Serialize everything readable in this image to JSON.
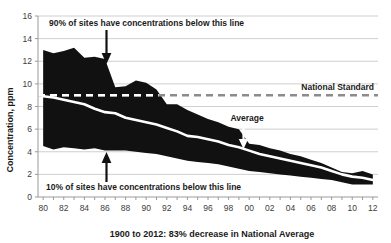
{
  "chart_data": {
    "type": "area",
    "title": "",
    "subtitle": "",
    "xlabel": "1900 to 2012: 83% decrease in National Average",
    "ylabel": "Concentration, ppm",
    "xlim": [
      1979.5,
      2012.5
    ],
    "ylim": [
      0,
      16
    ],
    "ytick_values": [
      0,
      2,
      4,
      6,
      8,
      10,
      12,
      14,
      16
    ],
    "ytick_labels": [
      "0",
      "2",
      "4",
      "6",
      "8",
      "10",
      "12",
      "14",
      "16"
    ],
    "xtick_labels": [
      "80",
      "82",
      "84",
      "86",
      "88",
      "90",
      "92",
      "94",
      "96",
      "98",
      "00",
      "02",
      "04",
      "06",
      "08",
      "10",
      "12"
    ],
    "xtick_values": [
      1980,
      1982,
      1984,
      1986,
      1988,
      1990,
      1992,
      1994,
      1996,
      1998,
      2000,
      2002,
      2004,
      2006,
      2008,
      2010,
      2012
    ],
    "minor_tick_step": 1,
    "grid": "horizontal",
    "legend": "none",
    "x": [
      1980,
      1981,
      1982,
      1983,
      1984,
      1985,
      1986,
      1987,
      1988,
      1989,
      1990,
      1991,
      1992,
      1993,
      1994,
      1995,
      1996,
      1997,
      1998,
      1999,
      2000,
      2001,
      2002,
      2003,
      2004,
      2005,
      2006,
      2007,
      2008,
      2009,
      2010,
      2011,
      2012
    ],
    "series": [
      {
        "name": "90th percentile",
        "role": "band-upper",
        "color": "#111111",
        "values": [
          13.0,
          12.7,
          12.9,
          13.2,
          12.3,
          12.4,
          12.2,
          9.7,
          9.8,
          10.3,
          10.1,
          9.5,
          8.2,
          8.2,
          7.7,
          7.3,
          6.9,
          6.6,
          6.2,
          6.0,
          4.7,
          4.6,
          4.3,
          4.1,
          3.8,
          3.6,
          3.3,
          3.0,
          2.6,
          2.2,
          2.1,
          2.3,
          2.0
        ]
      },
      {
        "name": "Average",
        "role": "mean-line",
        "color": "#ffffff",
        "values": [
          8.9,
          8.8,
          8.6,
          8.4,
          8.2,
          7.8,
          7.5,
          7.4,
          7.0,
          6.8,
          6.6,
          6.4,
          6.1,
          5.8,
          5.4,
          5.3,
          5.1,
          4.9,
          4.6,
          4.4,
          4.1,
          3.8,
          3.6,
          3.4,
          3.2,
          3.0,
          2.8,
          2.6,
          2.3,
          2.0,
          1.8,
          1.7,
          1.5
        ]
      },
      {
        "name": "10th percentile",
        "role": "band-lower",
        "color": "#111111",
        "values": [
          4.5,
          4.2,
          4.4,
          4.3,
          4.2,
          4.3,
          4.1,
          4.1,
          4.1,
          4.0,
          3.9,
          3.8,
          3.6,
          3.4,
          3.2,
          3.1,
          3.0,
          2.9,
          2.7,
          2.5,
          2.3,
          2.2,
          2.1,
          2.0,
          1.9,
          1.8,
          1.7,
          1.6,
          1.5,
          1.3,
          1.1,
          1.1,
          1.1
        ]
      }
    ],
    "reference_lines": [
      {
        "name": "National Standard",
        "value": 9.0,
        "style": "dashed",
        "color": "#8c8c8c",
        "label": "National Standard",
        "label_position": "right-above"
      }
    ],
    "annotations": [
      {
        "name": "upper-percentile-note",
        "text": "90% of sites have concentrations below this line",
        "arrow": "down",
        "points_to_year": 1986,
        "points_to_value": 12.2
      },
      {
        "name": "lower-percentile-note",
        "text": "10% of sites have concentrations below this line",
        "arrow": "up",
        "points_to_year": 1986,
        "points_to_value": 4.1
      },
      {
        "name": "average-note",
        "text": "Average",
        "arrow": "down",
        "points_to_year": 1999.5,
        "points_to_value": 4.4
      }
    ]
  },
  "colors": {
    "band": "#111111",
    "average_line": "#ffffff",
    "standard_line": "#8c8c8c",
    "gridline": "#c9c9c9",
    "axis": "#9a9a9a",
    "text": "#1a1a1a",
    "tick_text": "#3d3d3d",
    "background": "#ffffff"
  }
}
